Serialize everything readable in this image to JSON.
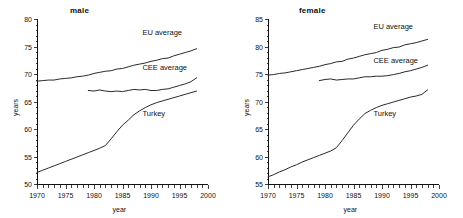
{
  "figure": {
    "panels": [
      {
        "id": "male",
        "title": "male",
        "xlabel": "year",
        "ylabel": "years"
      },
      {
        "id": "female",
        "title": "female",
        "xlabel": "year",
        "ylabel": "years"
      }
    ]
  },
  "chart_data": [
    {
      "type": "line",
      "title": "male",
      "xlabel": "year",
      "ylabel": "years",
      "xlim": [
        1970,
        2000
      ],
      "ylim": [
        50,
        80
      ],
      "xticks": [
        1970,
        1975,
        1980,
        1985,
        1990,
        1995,
        2000
      ],
      "yticks": [
        50,
        55,
        60,
        65,
        70,
        75,
        80
      ],
      "xtick_labels": [
        "1970",
        "1975",
        "1980",
        "1985",
        "1990",
        "1995",
        "2000"
      ],
      "ytick_labels": [
        "50",
        "55",
        "60",
        "65",
        "70",
        "75",
        "80"
      ],
      "minor_xtick_interval": 1,
      "grid": false,
      "legend": "inline-annotations",
      "series": [
        {
          "name": "EU average",
          "label_x": 1988.5,
          "label_y": 77.1,
          "x": [
            1970,
            1971,
            1972,
            1973,
            1974,
            1975,
            1976,
            1977,
            1978,
            1979,
            1980,
            1981,
            1982,
            1983,
            1984,
            1985,
            1986,
            1987,
            1988,
            1989,
            1990,
            1991,
            1992,
            1993,
            1994,
            1995,
            1996,
            1997,
            1998
          ],
          "y": [
            68.7,
            68.8,
            68.9,
            68.9,
            69.1,
            69.2,
            69.3,
            69.5,
            69.6,
            69.8,
            70.1,
            70.3,
            70.5,
            70.6,
            70.9,
            71.0,
            71.3,
            71.6,
            71.8,
            72.0,
            72.3,
            72.5,
            72.8,
            72.9,
            73.3,
            73.6,
            73.9,
            74.2,
            74.6
          ]
        },
        {
          "name": "CEE average",
          "label_x": 1988.5,
          "label_y": 70.7,
          "x": [
            1979,
            1980,
            1981,
            1982,
            1983,
            1984,
            1985,
            1986,
            1987,
            1988,
            1989,
            1990,
            1991,
            1992,
            1993,
            1994,
            1995,
            1996,
            1997,
            1998
          ],
          "y": [
            67.0,
            66.9,
            67.1,
            66.9,
            66.8,
            66.9,
            66.8,
            67.0,
            67.2,
            67.1,
            67.2,
            67.0,
            67.0,
            67.2,
            67.3,
            67.6,
            67.9,
            68.2,
            68.6,
            69.3
          ]
        },
        {
          "name": "Turkey",
          "label_x": 1988.5,
          "label_y": 62.3,
          "x": [
            1970,
            1971,
            1972,
            1973,
            1974,
            1975,
            1976,
            1977,
            1978,
            1979,
            1980,
            1981,
            1982,
            1983,
            1984,
            1985,
            1986,
            1987,
            1988,
            1989,
            1990,
            1991,
            1992,
            1993,
            1994,
            1995,
            1996,
            1997,
            1998
          ],
          "y": [
            52.1,
            52.5,
            52.9,
            53.3,
            53.7,
            54.1,
            54.5,
            54.9,
            55.3,
            55.7,
            56.1,
            56.5,
            57.0,
            58.2,
            59.5,
            60.7,
            61.6,
            62.6,
            63.3,
            63.9,
            64.4,
            64.8,
            65.1,
            65.4,
            65.7,
            66.0,
            66.3,
            66.6,
            66.9
          ]
        }
      ]
    },
    {
      "type": "line",
      "title": "female",
      "xlabel": "year",
      "ylabel": "years",
      "xlim": [
        1970,
        2000
      ],
      "ylim": [
        55,
        85
      ],
      "xticks": [
        1970,
        1975,
        1980,
        1985,
        1990,
        1995,
        2000
      ],
      "yticks": [
        55,
        60,
        65,
        70,
        75,
        80,
        85
      ],
      "xtick_labels": [
        "1970",
        "1975",
        "1980",
        "1985",
        "1990",
        "1995",
        "2000"
      ],
      "ytick_labels": [
        "55",
        "60",
        "65",
        "70",
        "75",
        "80",
        "85"
      ],
      "minor_xtick_interval": 1,
      "grid": false,
      "legend": "inline-annotations",
      "series": [
        {
          "name": "EU average",
          "label_x": 1988.5,
          "label_y": 83.2,
          "x": [
            1970,
            1971,
            1972,
            1973,
            1974,
            1975,
            1976,
            1977,
            1978,
            1979,
            1980,
            1981,
            1982,
            1983,
            1984,
            1985,
            1986,
            1987,
            1988,
            1989,
            1990,
            1991,
            1992,
            1993,
            1994,
            1995,
            1996,
            1997,
            1998
          ],
          "y": [
            74.8,
            74.9,
            75.1,
            75.2,
            75.4,
            75.6,
            75.8,
            76.0,
            76.2,
            76.4,
            76.7,
            76.9,
            77.2,
            77.3,
            77.7,
            77.9,
            78.2,
            78.5,
            78.7,
            78.9,
            79.3,
            79.5,
            79.8,
            79.9,
            80.3,
            80.5,
            80.7,
            81.0,
            81.3
          ]
        },
        {
          "name": "CEE average",
          "label_x": 1988.5,
          "label_y": 77.0,
          "x": [
            1979,
            1980,
            1981,
            1982,
            1983,
            1984,
            1985,
            1986,
            1987,
            1988,
            1989,
            1990,
            1991,
            1992,
            1993,
            1994,
            1995,
            1996,
            1997,
            1998
          ],
          "y": [
            73.8,
            74.0,
            74.1,
            73.9,
            74.0,
            74.1,
            74.1,
            74.3,
            74.5,
            74.5,
            74.6,
            74.6,
            74.7,
            74.9,
            75.1,
            75.4,
            75.6,
            75.9,
            76.2,
            76.6
          ]
        },
        {
          "name": "Turkey",
          "label_x": 1988.5,
          "label_y": 67.3,
          "x": [
            1970,
            1971,
            1972,
            1973,
            1974,
            1975,
            1976,
            1977,
            1978,
            1979,
            1980,
            1981,
            1982,
            1983,
            1984,
            1985,
            1986,
            1987,
            1988,
            1989,
            1990,
            1991,
            1992,
            1993,
            1994,
            1995,
            1996,
            1997,
            1998
          ],
          "y": [
            56.3,
            56.7,
            57.2,
            57.6,
            58.1,
            58.5,
            59.0,
            59.4,
            59.8,
            60.2,
            60.6,
            61.0,
            61.6,
            62.9,
            64.3,
            65.7,
            66.8,
            67.8,
            68.4,
            68.9,
            69.3,
            69.6,
            69.9,
            70.2,
            70.5,
            70.8,
            71.0,
            71.3,
            72.1
          ]
        }
      ]
    }
  ]
}
